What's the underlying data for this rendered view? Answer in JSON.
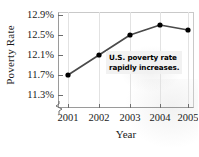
{
  "chart_data": {
    "type": "line",
    "title": "",
    "xlabel": "Year",
    "ylabel": "Poverty Rate",
    "categories": [
      "2001",
      "2002",
      "2003",
      "2004",
      "2005"
    ],
    "values": [
      11.7,
      12.1,
      12.5,
      12.7,
      12.6
    ],
    "series": [
      {
        "name": "U.S. poverty rate",
        "values": [
          11.7,
          12.1,
          12.5,
          12.7,
          12.6
        ]
      }
    ],
    "x": [
      2001,
      2002,
      2003,
      2004,
      2005
    ],
    "ylim": [
      11.1,
      13.0
    ],
    "yticks": [
      "11.3%",
      "11.7%",
      "12.1%",
      "12.5%",
      "12.9%"
    ],
    "ytick_values": [
      11.3,
      11.7,
      12.1,
      12.5,
      12.9
    ],
    "xticks": [
      "2001",
      "2002",
      "2003",
      "2004",
      "2005"
    ],
    "grid": "vertical-faint",
    "legend": "none",
    "axis_break": true,
    "annotations": [
      {
        "line1": "U.S. poverty rate",
        "line2": "rapidly increases."
      }
    ],
    "colors": {
      "line": "#4a4a4a",
      "marker": "#000000",
      "axis": "#9a9a9a",
      "grid": "#e2e2e2",
      "text": "#1a1a1a",
      "callout_bg": "#f1f1f1"
    }
  }
}
